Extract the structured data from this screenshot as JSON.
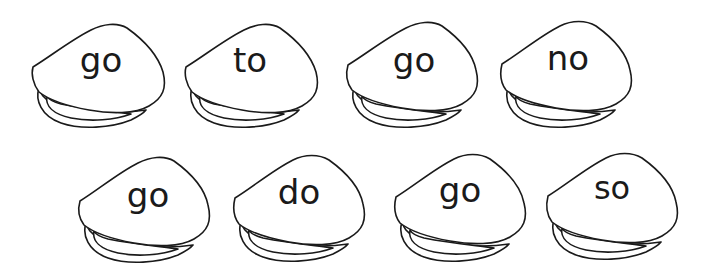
{
  "worksheet": {
    "shells": [
      {
        "word": "go"
      },
      {
        "word": "to"
      },
      {
        "word": "go"
      },
      {
        "word": "no"
      },
      {
        "word": "go"
      },
      {
        "word": "do"
      },
      {
        "word": "go"
      },
      {
        "word": "so"
      }
    ]
  },
  "colors": {
    "background": "#ffffff",
    "ink": "#1a1a1a"
  }
}
